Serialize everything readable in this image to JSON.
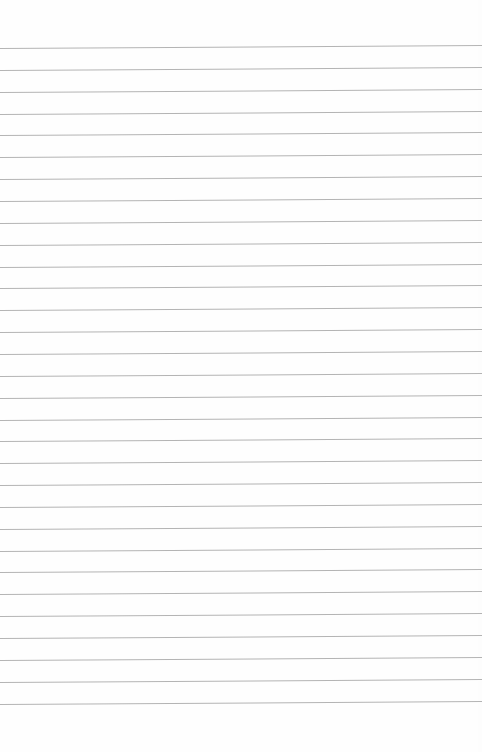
{
  "page": {
    "type": "ruled-notepad-sheet",
    "background_color": "#fefefe",
    "line_color": "#b4b4b4",
    "line_count": 31,
    "first_line_y": 48,
    "line_spacing": 21.85,
    "text": ""
  }
}
